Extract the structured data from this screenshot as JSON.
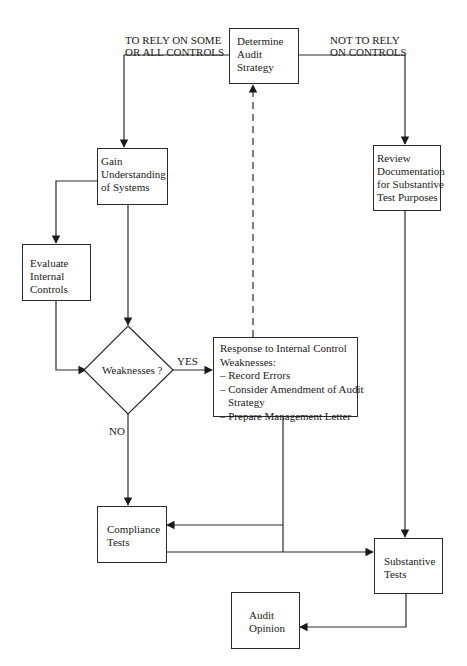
{
  "diagram": {
    "type": "flowchart",
    "nodes": {
      "determine": {
        "lines": [
          "Determine",
          "Audit",
          "Strategy"
        ]
      },
      "gain": {
        "lines": [
          "Gain",
          "Understanding",
          "of Systems"
        ]
      },
      "review": {
        "lines": [
          "Review",
          "Documentation",
          "for Substantive",
          "Test Purposes"
        ]
      },
      "evaluate": {
        "lines": [
          "Evaluate",
          "Internal",
          "Controls"
        ]
      },
      "weaknesses": {
        "label": "Weaknesses ?"
      },
      "response": {
        "lines": [
          "Response to Internal Control",
          "Weaknesses:",
          "– Record Errors",
          "– Consider Amendment of Audit",
          "Strategy",
          "– Prepare Management Letter"
        ]
      },
      "compliance": {
        "lines": [
          "Compliance",
          "Tests"
        ]
      },
      "substantive": {
        "lines": [
          "Substantive",
          "Tests"
        ]
      },
      "opinion": {
        "lines": [
          "Audit",
          "Opinion"
        ]
      }
    },
    "edge_labels": {
      "rely": [
        "TO RELY ON SOME",
        "OR ALL CONTROLS"
      ],
      "not_rely": [
        "NOT TO RELY",
        "ON CONTROLS"
      ],
      "yes": "YES",
      "no": "NO"
    },
    "colors": {
      "stroke": "#2a2a2a",
      "background": "#ffffff",
      "text": "#1a1a1a"
    }
  }
}
